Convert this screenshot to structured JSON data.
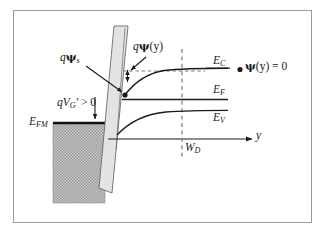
{
  "figure": {
    "background_color": "#ffffff",
    "frame_color": "#9a9a9a",
    "curve_color": "#1a1a1a",
    "oxide_fill": "#e3e3e3",
    "metal_fill": "#b0b0b0"
  },
  "labels": {
    "gate_bias": {
      "q": "q",
      "v": "V",
      "sub": "G",
      "prime": "′",
      "rel": " > 0"
    },
    "gate_bias_text": "qV′G > 0",
    "metal_fermi": {
      "e": "E",
      "sub": "FM"
    },
    "metal_fermi_text": "EFM",
    "surface_potential": {
      "q": "q",
      "psi": "ψ",
      "sub": "s"
    },
    "surface_potential_text": "qψs",
    "band_bending": {
      "q": "q",
      "psi": "ψ",
      "arg": "(y)"
    },
    "band_bending_text": "qψ(y)",
    "conduction_band": {
      "e": "E",
      "sub": "C"
    },
    "conduction_band_text": "EC",
    "fermi_level": {
      "e": "E",
      "sub": "F"
    },
    "fermi_level_text": "EF",
    "valence_band": {
      "e": "E",
      "sub": "V"
    },
    "valence_band_text": "EV",
    "bulk_condition": {
      "psi": "ψ",
      "arg": "(y)",
      "eq": " = 0"
    },
    "bulk_condition_text": "ψ(y) = 0",
    "depletion_width": {
      "w": "W",
      "sub": "D"
    },
    "depletion_width_text": "WD",
    "axis_y": "y"
  },
  "chart_data": {
    "type": "line",
    "xlabel": "y",
    "ylabel": "Energy",
    "annotations": [
      "qV′G > 0",
      "EFM",
      "qψs",
      "qψ(y)",
      "ψ(y) = 0",
      "WD"
    ],
    "regions": [
      {
        "name": "metal",
        "x_range": [
          0,
          0.3
        ],
        "fill": "#b0b0b0",
        "hatch": "dotted"
      },
      {
        "name": "oxide",
        "x_range": [
          0.3,
          0.4
        ],
        "fill": "#e3e3e3"
      },
      {
        "name": "semiconductor",
        "x_range": [
          0.4,
          1.0
        ],
        "fill": "#ffffff"
      }
    ],
    "series": [
      {
        "name": "EC",
        "note": "conduction band edge, bends down toward oxide interface",
        "x": [
          0.4,
          0.48,
          0.56,
          0.64,
          0.72,
          0.8,
          0.9,
          1.0
        ],
        "y": [
          0.585,
          0.7,
          0.765,
          0.8,
          0.818,
          0.826,
          0.83,
          0.832
        ]
      },
      {
        "name": "EF",
        "note": "Fermi level, flat through semiconductor",
        "x": [
          0.4,
          1.0
        ],
        "y": [
          0.56,
          0.56
        ]
      },
      {
        "name": "EV",
        "note": "valence band edge, parallel bending to EC",
        "x": [
          0.4,
          0.48,
          0.56,
          0.64,
          0.72,
          0.8,
          0.9,
          1.0
        ],
        "y": [
          0.2,
          0.315,
          0.38,
          0.415,
          0.433,
          0.441,
          0.445,
          0.447
        ]
      },
      {
        "name": "EFM",
        "note": "metal Fermi level, flat in metal region",
        "x": [
          0.1,
          0.32
        ],
        "y": [
          0.385,
          0.385
        ]
      }
    ],
    "reference_lines": [
      {
        "name": "bulk-EC-dashed",
        "orientation": "horizontal",
        "value": 0.832,
        "style": "dashed"
      },
      {
        "name": "depletion-edge",
        "orientation": "vertical",
        "label": "WD",
        "style": "dashed"
      },
      {
        "name": "y-axis",
        "orientation": "horizontal",
        "style": "solid-arrow"
      }
    ],
    "markers": [
      {
        "name": "surface-point",
        "label": "qψs endpoint"
      },
      {
        "name": "bulk-point",
        "label": "ψ(y) = 0 endpoint"
      }
    ],
    "grid": false,
    "legend": "none"
  }
}
